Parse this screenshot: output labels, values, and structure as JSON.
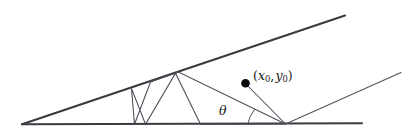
{
  "figure": {
    "background_color": "#ffffff",
    "line_color": "#3a3a42",
    "ray_color": "#4a4a55",
    "point_color": "#0a0a0a",
    "width": 406,
    "height": 134,
    "labels": {
      "point_open_paren": "(",
      "point_x": "x",
      "point_x_sub": "0",
      "point_comma": ",",
      "point_y": "y",
      "point_y_sub": "0",
      "point_close_paren": ")",
      "point_full": "(x0, y0)",
      "angle": "θ"
    },
    "elements": {
      "lower_boundary_name": "lower wedge boundary",
      "upper_boundary_name": "upper wedge boundary",
      "outer_ray_name": "outgoing reflected ray",
      "bouncing_path_name": "multiply reflected ray path",
      "point_marker_name": "source point (x0, y0)",
      "angle_arc_name": "incidence angle theta arc"
    },
    "geometry": {
      "apex": [
        22,
        124
      ],
      "lower_boundary": [
        [
          22,
          124
        ],
        [
          362,
          123
        ]
      ],
      "upper_boundary": [
        [
          22,
          124
        ],
        [
          345,
          16
        ]
      ],
      "point_dot": [
        245,
        83
      ],
      "outgoing_ray": [
        [
          285,
          124
        ],
        [
          400,
          73
        ]
      ],
      "ray_vertices": [
        [
          245,
          83
        ],
        [
          285,
          124
        ],
        [
          200,
          124
        ],
        [
          175,
          73
        ],
        [
          145,
          124
        ],
        [
          131,
          88
        ],
        [
          134,
          124
        ],
        [
          150,
          82
        ],
        [
          178,
          72
        ],
        [
          285,
          124
        ]
      ],
      "theta_arc_center": [
        285,
        124
      ],
      "theta_arc_radius": 38
    }
  }
}
